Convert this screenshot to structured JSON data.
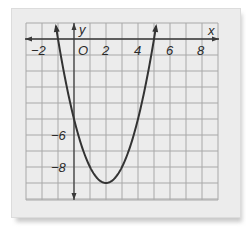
{
  "chart_data": {
    "type": "line",
    "title": "",
    "xlabel": "x",
    "ylabel": "y",
    "xlim": [
      -3,
      9
    ],
    "ylim": [
      -10,
      1
    ],
    "grid": true,
    "x_ticks": [
      -2,
      0,
      2,
      4,
      6,
      8
    ],
    "x_tick_labels": [
      "−2",
      "O",
      "2",
      "4",
      "6",
      "8"
    ],
    "y_ticks": [
      -6,
      -8
    ],
    "y_tick_labels": [
      "−6",
      "−8"
    ],
    "series": [
      {
        "name": "parabola",
        "equation": "y = (x - 2)^2 - 9",
        "x": [
          -1.6,
          -1,
          0,
          1,
          2,
          3,
          4,
          5,
          5.6
        ],
        "values": [
          3.96,
          0,
          -5,
          -8,
          -9,
          -8,
          -5,
          0,
          3.96
        ],
        "vertex": [
          2,
          -9
        ],
        "roots": [
          -1,
          5
        ],
        "color": "#333333"
      }
    ]
  },
  "labels": {
    "x_axis": "x",
    "y_axis": "y",
    "origin": "O",
    "x_ticks": [
      "−2",
      "2",
      "4",
      "6",
      "8"
    ],
    "y_ticks": [
      "−6",
      "−8"
    ]
  },
  "colors": {
    "paper": "#ececec",
    "grid": "#a8a8a8",
    "axis": "#3a3a3a",
    "curve": "#333333"
  }
}
